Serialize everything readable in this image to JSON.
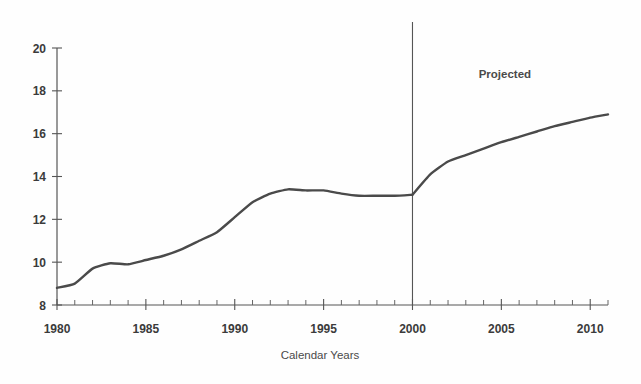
{
  "chart_data": {
    "type": "line",
    "title": "",
    "xlabel": "Calendar Years",
    "ylabel": "",
    "xlim": [
      1980,
      2011
    ],
    "ylim": [
      8,
      20
    ],
    "grid": false,
    "legend_position": "none",
    "x_ticks_major": [
      1980,
      1985,
      1990,
      1995,
      2000,
      2005,
      2010
    ],
    "x_tick_labels": [
      "1980",
      "1985",
      "1990",
      "1995",
      "2000",
      "2005",
      "2010"
    ],
    "x_ticks_minor_step": 1,
    "y_ticks": [
      8,
      10,
      12,
      14,
      16,
      18,
      20
    ],
    "y_tick_labels": [
      "8",
      "10",
      "12",
      "14",
      "16",
      "18",
      "20"
    ],
    "annotations": [
      {
        "text": "Projected",
        "x": 2005.2,
        "y": 18.6
      }
    ],
    "reference_lines": [
      {
        "x": 2000,
        "label": "",
        "style": "solid"
      }
    ],
    "series": [
      {
        "name": "Historical",
        "color": "#4a4a4a",
        "x": [
          1980,
          1981,
          1982,
          1983,
          1984,
          1985,
          1986,
          1987,
          1988,
          1989,
          1990,
          1991,
          1992,
          1993,
          1994,
          1995,
          1996,
          1997,
          1998,
          1999,
          2000
        ],
        "values": [
          8.8,
          9.0,
          9.7,
          9.95,
          9.9,
          10.1,
          10.3,
          10.6,
          11.0,
          11.4,
          12.1,
          12.8,
          13.2,
          13.4,
          13.35,
          13.35,
          13.2,
          13.1,
          13.1,
          13.1,
          13.15
        ]
      },
      {
        "name": "Projected",
        "color": "#4a4a4a",
        "x": [
          2000,
          2001,
          2002,
          2003,
          2004,
          2005,
          2006,
          2007,
          2008,
          2009,
          2010,
          2011
        ],
        "values": [
          13.15,
          14.1,
          14.7,
          15.0,
          15.3,
          15.6,
          15.85,
          16.1,
          16.35,
          16.55,
          16.75,
          16.9
        ]
      }
    ]
  },
  "axes": {
    "x_axis_name": "calendar-years-axis",
    "y_axis_name": "value-axis"
  }
}
